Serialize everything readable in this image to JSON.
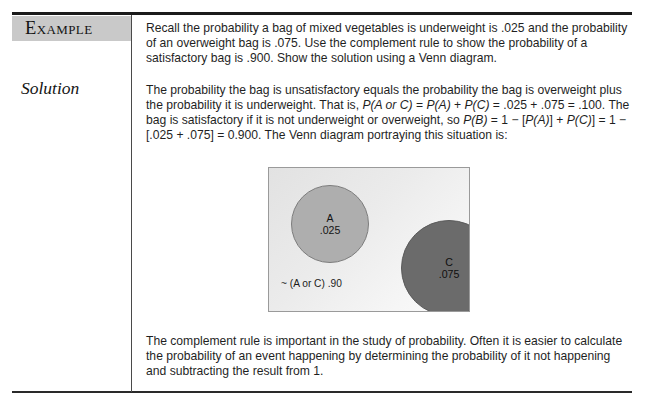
{
  "page": {
    "example_label": "Example",
    "solution_label": "Solution"
  },
  "problem": {
    "text": "Recall the probability a bag of mixed vegetables is underweight is .025 and the probability of an overweight bag is .075. Use the complement rule to show the probability of a satisfactory bag is .900. Show the solution using a Venn diagram."
  },
  "solution": {
    "part1": "The probability the bag is unsatisfactory equals the probability the bag is overweight plus the probability it is underweight. That is, ",
    "math1": "P(A or C)",
    "part2": " = ",
    "math2": "P(A)",
    "part3": " + ",
    "math3": "P(C)",
    "part4": " = .025 + .075 = .100. The bag is satisfactory if it is not underweight or overweight, so ",
    "math4": "P(B)",
    "part5": " = 1 − [",
    "math5": "P(A)",
    "part6": "] + ",
    "math6": "P(C)",
    "part7": "] = 1 − [.025 + .075] = 0.900. The Venn diagram portraying this situation is:"
  },
  "venn": {
    "circle_a": {
      "name": "A",
      "value": ".025"
    },
    "circle_c": {
      "name": "C",
      "value": ".075"
    },
    "complement": "~ (A or C)  .90",
    "colors": {
      "circle_a_fill": "#aeaeae",
      "circle_c_fill": "#6b6b6b",
      "box_background": "#e9e9e9",
      "box_border": "#9a9a9a"
    }
  },
  "closing": {
    "text": "The complement rule is important in the study of probability. Often it is easier to calculate the probability of an event happening by determining the probability of it not happening and subtracting the result from 1."
  }
}
